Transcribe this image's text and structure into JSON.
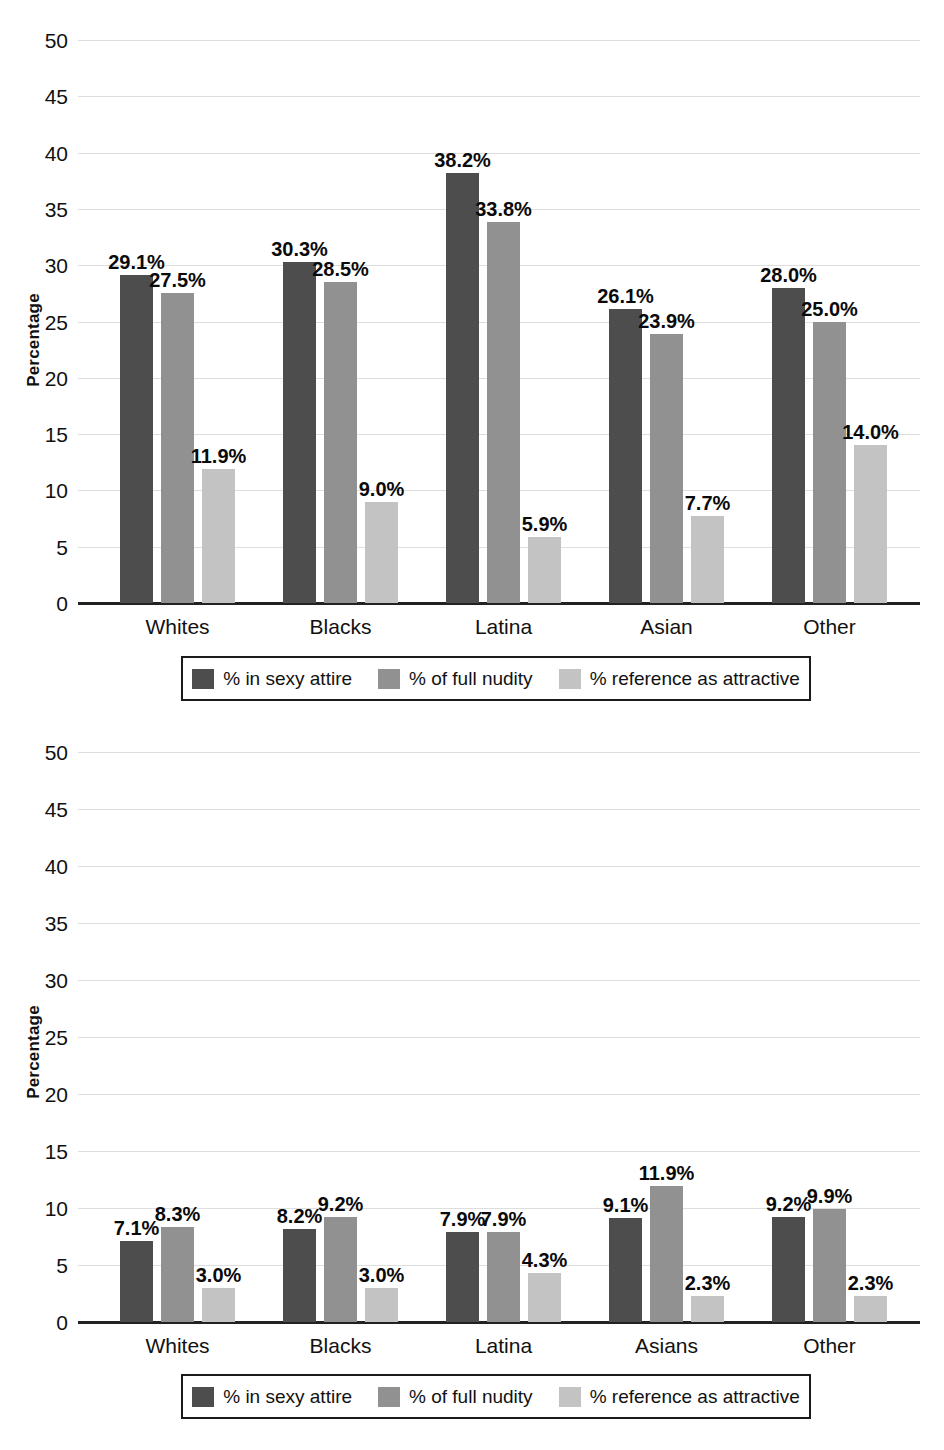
{
  "figure": {
    "background": "#ffffff",
    "series_colors": [
      "#4d4d4d",
      "#919191",
      "#c3c3c3"
    ]
  },
  "chart_data": [
    {
      "id": "top-chart",
      "type": "bar",
      "title": "",
      "xlabel": "",
      "ylabel": "Percentage",
      "ylim": [
        0,
        50
      ],
      "ytick_values": [
        0,
        5,
        10,
        15,
        20,
        25,
        30,
        35,
        40,
        45,
        50
      ],
      "ytick_labels": [
        "0",
        "5",
        "10",
        "15",
        "20",
        "25",
        "30",
        "35",
        "40",
        "45",
        "50"
      ],
      "grid": true,
      "legend_position": "below-axis",
      "categories": [
        "Whites",
        "Blacks",
        "Latina",
        "Asian",
        "Other"
      ],
      "series": [
        {
          "name": "% in sexy attire",
          "color": "#4d4d4d",
          "values": [
            29.1,
            30.3,
            38.2,
            26.1,
            28.0
          ],
          "labels": [
            "29.1%",
            "30.3%",
            "38.2%",
            "26.1%",
            "28.0%"
          ]
        },
        {
          "name": "% of full nudity",
          "color": "#919191",
          "values": [
            27.5,
            28.5,
            33.8,
            23.9,
            25.0
          ],
          "labels": [
            "27.5%",
            "28.5%",
            "33.8%",
            "23.9%",
            "25.0%"
          ]
        },
        {
          "name": "% reference as attractive",
          "color": "#c3c3c3",
          "values": [
            11.9,
            9.0,
            5.9,
            7.7,
            14.0
          ],
          "labels": [
            "11.9%",
            "9.0%",
            "5.9%",
            "7.7%",
            "14.0%"
          ]
        }
      ]
    },
    {
      "id": "bottom-chart",
      "type": "bar",
      "title": "",
      "xlabel": "",
      "ylabel": "Percentage",
      "ylim": [
        0,
        50
      ],
      "ytick_values": [
        0,
        5,
        10,
        15,
        20,
        25,
        30,
        35,
        40,
        45,
        50
      ],
      "ytick_labels": [
        "0",
        "5",
        "10",
        "15",
        "20",
        "25",
        "30",
        "35",
        "40",
        "45",
        "50"
      ],
      "grid": true,
      "legend_position": "below-axis",
      "categories": [
        "Whites",
        "Blacks",
        "Latina",
        "Asians",
        "Other"
      ],
      "series": [
        {
          "name": "% in sexy attire",
          "color": "#4d4d4d",
          "values": [
            7.1,
            8.2,
            7.9,
            9.1,
            9.2
          ],
          "labels": [
            "7.1%",
            "8.2%",
            "7.9%",
            "9.1%",
            "9.2%"
          ]
        },
        {
          "name": "% of full nudity",
          "color": "#919191",
          "values": [
            8.3,
            9.2,
            7.9,
            11.9,
            9.9
          ],
          "labels": [
            "8.3%",
            "9.2%",
            "7.9%",
            "11.9%",
            "9.9%"
          ]
        },
        {
          "name": "% reference as attractive",
          "color": "#c3c3c3",
          "values": [
            3.0,
            3.0,
            4.3,
            2.3,
            2.3
          ],
          "labels": [
            "3.0%",
            "3.0%",
            "4.3%",
            "2.3%",
            "2.3%"
          ]
        }
      ]
    }
  ]
}
